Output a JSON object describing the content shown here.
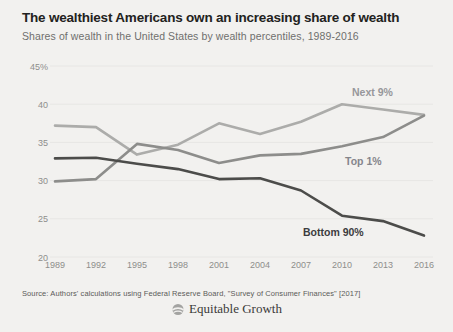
{
  "header": {
    "title": "The wealthiest Americans own an increasing share of wealth",
    "subtitle": "Shares of wealth in the United States by wealth percentiles, 1989-2016"
  },
  "chart_data": {
    "type": "line",
    "title": "The wealthiest Americans own an increasing share of wealth",
    "subtitle": "Shares of wealth in the United States by wealth percentiles, 1989-2016",
    "xlabel": "",
    "ylabel": "",
    "x": [
      1989,
      1992,
      1995,
      1998,
      2001,
      2004,
      2007,
      2010,
      2013,
      2016
    ],
    "x_tick_labels": [
      "1989",
      "1992",
      "1995",
      "1998",
      "2001",
      "2004",
      "2007",
      "2010",
      "2013",
      "2016"
    ],
    "y_ticks": [
      45,
      40,
      35,
      30,
      25,
      20
    ],
    "y_tick_labels": [
      "45%",
      "40",
      "35",
      "30",
      "25",
      "20"
    ],
    "ylim": [
      20,
      45
    ],
    "grid": true,
    "legend": "inline-labels",
    "series": [
      {
        "name": "Next 9%",
        "color": "#acacaa",
        "label_color": "#97979b",
        "values": [
          37.2,
          37.0,
          33.4,
          34.7,
          37.5,
          36.1,
          37.7,
          40.0,
          39.3,
          38.6
        ],
        "label_x": 352,
        "label_y": 96
      },
      {
        "name": "Top 1%",
        "color": "#8d8d8b",
        "label_color": "#85858b",
        "values": [
          29.9,
          30.2,
          34.8,
          34.0,
          32.3,
          33.3,
          33.5,
          34.5,
          35.7,
          38.5
        ],
        "label_x": 345,
        "label_y": 165
      },
      {
        "name": "Bottom 90%",
        "color": "#4c4c4a",
        "label_color": "#3c3c3e",
        "values": [
          32.9,
          33.0,
          32.2,
          31.5,
          30.2,
          30.3,
          28.7,
          25.4,
          24.7,
          22.8
        ],
        "label_x": 303,
        "label_y": 236
      }
    ]
  },
  "footer": {
    "source": "Source: Authors' calculations using Federal Reserve Board, \"Survey of Consumer Finances\" [2017]",
    "logo_text": "Equitable Growth"
  }
}
